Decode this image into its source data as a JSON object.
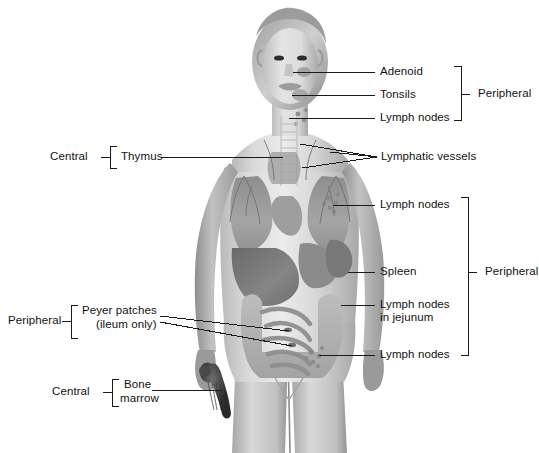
{
  "figure": {
    "background_color": "#ffffff",
    "line_color": "#1a1a1a",
    "text_color": "#111111"
  },
  "labels": {
    "adenoid": "Adenoid",
    "tonsils": "Tonsils",
    "lymph_nodes_neck": "Lymph nodes",
    "lymphatic_vessels": "Lymphatic vessels",
    "lymph_nodes_axillary": "Lymph nodes",
    "spleen": "Spleen",
    "lymph_nodes_jejunum_line1": "Lymph nodes",
    "lymph_nodes_jejunum_line2": "in jejunum",
    "lymph_nodes_inguinal": "Lymph nodes",
    "thymus": "Thymus",
    "peyer_patches_line1": "Peyer patches",
    "peyer_patches_line2": "(ileum only)",
    "bone_marrow_line1": "Bone",
    "bone_marrow_line2": "marrow"
  },
  "groups": {
    "central_thymus": "Central",
    "central_bone_marrow": "Central",
    "peripheral_head": "Peripheral",
    "peripheral_trunk": "Peripheral",
    "peripheral_peyer": "Peripheral"
  }
}
